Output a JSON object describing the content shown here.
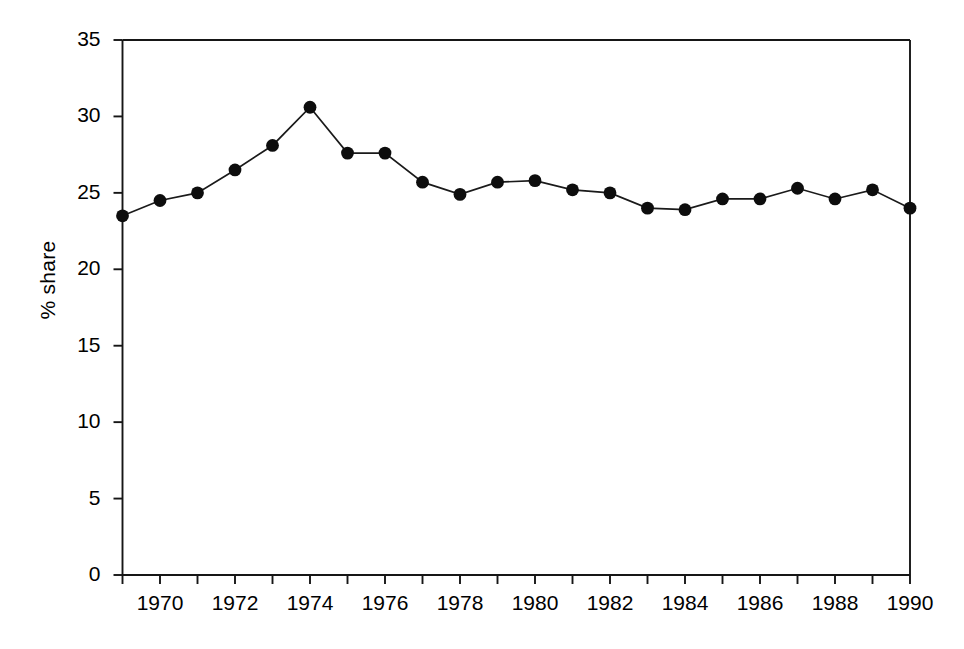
{
  "chart_data": {
    "type": "line",
    "title": "",
    "xlabel": "",
    "ylabel": "% share",
    "xlim": [
      1969,
      1990
    ],
    "ylim": [
      0,
      35
    ],
    "grid": false,
    "legend": null,
    "y_ticks": [
      0,
      5,
      10,
      15,
      20,
      25,
      30,
      35
    ],
    "y_tick_labels": [
      "0",
      "5",
      "10",
      "15",
      "20",
      "25",
      "30",
      "35"
    ],
    "x_ticks": [
      1969,
      1970,
      1971,
      1972,
      1973,
      1974,
      1975,
      1976,
      1977,
      1978,
      1979,
      1980,
      1981,
      1982,
      1983,
      1984,
      1985,
      1986,
      1987,
      1988,
      1989,
      1990
    ],
    "x_tick_labels": [
      "",
      "1970",
      "",
      "1972",
      "",
      "1974",
      "",
      "1976",
      "",
      "1978",
      "",
      "1980",
      "",
      "1982",
      "",
      "1984",
      "",
      "1986",
      "",
      "1988",
      "",
      "1990"
    ],
    "x": [
      1969,
      1970,
      1971,
      1972,
      1973,
      1974,
      1975,
      1976,
      1977,
      1978,
      1979,
      1980,
      1981,
      1982,
      1983,
      1984,
      1985,
      1986,
      1987,
      1988,
      1989,
      1990
    ],
    "values": [
      23.5,
      24.5,
      25.0,
      26.5,
      28.1,
      30.6,
      27.6,
      27.6,
      25.7,
      24.9,
      25.7,
      25.8,
      25.2,
      25.0,
      24.0,
      23.9,
      24.6,
      24.6,
      25.3,
      24.6,
      25.2,
      24.0
    ],
    "series": [
      {
        "name": "% share",
        "marker": "filled-circle",
        "color": "#0d0d0d",
        "values": [
          23.5,
          24.5,
          25.0,
          26.5,
          28.1,
          30.6,
          27.6,
          27.6,
          25.7,
          24.9,
          25.7,
          25.8,
          25.2,
          25.0,
          24.0,
          23.9,
          24.6,
          24.6,
          25.3,
          24.6,
          25.2,
          24.0
        ]
      }
    ]
  }
}
